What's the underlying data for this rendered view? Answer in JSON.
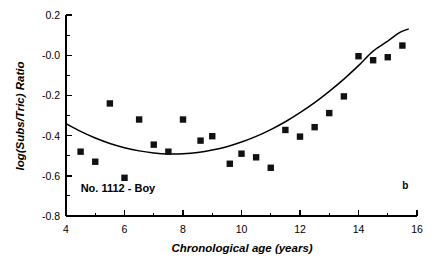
{
  "chart_data": {
    "type": "scatter",
    "title": "",
    "xlabel": "Chronological age (years)",
    "ylabel": "log(Subs/Tric) Ratio",
    "xlim": [
      4,
      16
    ],
    "ylim": [
      -0.8,
      0.2
    ],
    "grid": false,
    "legend": null,
    "xticks": [
      4,
      6,
      8,
      10,
      12,
      14,
      16
    ],
    "xtick_labels": [
      "4",
      "6",
      "8",
      "10",
      "12",
      "14",
      "16"
    ],
    "xminor_ticks": [
      5,
      7,
      9,
      11,
      13,
      15
    ],
    "yticks": [
      0.2,
      -0.0,
      -0.2,
      -0.4,
      -0.6,
      -0.8
    ],
    "ytick_labels": [
      "0.2",
      "-0.0",
      "-0.2",
      "-0.4",
      "-0.6",
      "-0.8"
    ],
    "yminor_ticks": [
      0.1,
      -0.1,
      -0.3,
      -0.5,
      -0.7
    ],
    "annotations": [
      {
        "name": "subject-label",
        "text": "No. 1112 - Boy",
        "x": 4.5,
        "y": -0.68
      },
      {
        "name": "panel-label",
        "text": "b",
        "x": 15.6,
        "y": -0.665
      }
    ],
    "series": [
      {
        "name": "observations",
        "type": "scatter",
        "marker": "square",
        "color": "#111111",
        "points": [
          {
            "x": 4.5,
            "y": -0.48
          },
          {
            "x": 5.0,
            "y": -0.53
          },
          {
            "x": 5.5,
            "y": -0.24
          },
          {
            "x": 6.0,
            "y": -0.61
          },
          {
            "x": 6.5,
            "y": -0.32
          },
          {
            "x": 7.0,
            "y": -0.445
          },
          {
            "x": 7.5,
            "y": -0.48
          },
          {
            "x": 8.0,
            "y": -0.32
          },
          {
            "x": 8.6,
            "y": -0.425
          },
          {
            "x": 9.0,
            "y": -0.403
          },
          {
            "x": 9.6,
            "y": -0.54
          },
          {
            "x": 10.0,
            "y": -0.49
          },
          {
            "x": 10.5,
            "y": -0.508
          },
          {
            "x": 11.0,
            "y": -0.56
          },
          {
            "x": 11.5,
            "y": -0.372
          },
          {
            "x": 12.0,
            "y": -0.405
          },
          {
            "x": 12.5,
            "y": -0.358
          },
          {
            "x": 13.0,
            "y": -0.288
          },
          {
            "x": 13.5,
            "y": -0.205
          },
          {
            "x": 14.0,
            "y": -0.005
          },
          {
            "x": 14.5,
            "y": -0.025
          },
          {
            "x": 15.0,
            "y": -0.01
          },
          {
            "x": 15.5,
            "y": 0.048
          }
        ]
      },
      {
        "name": "quadratic-fit",
        "type": "line",
        "color": "#000000",
        "points": [
          {
            "x": 4.0,
            "y": -0.34
          },
          {
            "x": 4.5,
            "y": -0.379
          },
          {
            "x": 5.0,
            "y": -0.412
          },
          {
            "x": 5.5,
            "y": -0.439
          },
          {
            "x": 6.0,
            "y": -0.46
          },
          {
            "x": 6.5,
            "y": -0.476
          },
          {
            "x": 7.0,
            "y": -0.486
          },
          {
            "x": 7.5,
            "y": -0.491
          },
          {
            "x": 8.0,
            "y": -0.49
          },
          {
            "x": 8.5,
            "y": -0.484
          },
          {
            "x": 9.0,
            "y": -0.472
          },
          {
            "x": 9.5,
            "y": -0.455
          },
          {
            "x": 10.0,
            "y": -0.432
          },
          {
            "x": 10.5,
            "y": -0.404
          },
          {
            "x": 11.0,
            "y": -0.37
          },
          {
            "x": 11.5,
            "y": -0.331
          },
          {
            "x": 12.0,
            "y": -0.286
          },
          {
            "x": 12.5,
            "y": -0.236
          },
          {
            "x": 13.0,
            "y": -0.18
          },
          {
            "x": 13.5,
            "y": -0.119
          },
          {
            "x": 14.0,
            "y": -0.052
          },
          {
            "x": 14.5,
            "y": 0.02
          },
          {
            "x": 15.0,
            "y": 0.07
          },
          {
            "x": 15.4,
            "y": 0.112
          },
          {
            "x": 15.7,
            "y": 0.13
          }
        ]
      }
    ]
  }
}
